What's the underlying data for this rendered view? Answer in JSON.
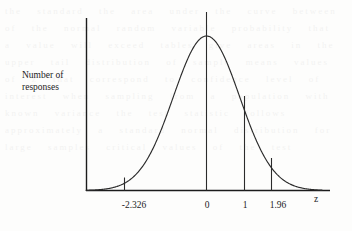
{
  "figure": {
    "background_color": "#fdfdfc",
    "ink_color": "#1c1c1c",
    "y_axis_label_line1": "Number of",
    "y_axis_label_line2": "responses",
    "x_axis_label": "z"
  },
  "bleed_text": "the standard the area under the curve between of the normal random variable probability that a value will exceed tables give areas in the upper tail distribution of sample means values of z that correspond to confidence level of interest when sampling from a population with known variance the test statistic follows approximately a standard normal distribution for large samples critical values of the test",
  "chart_data": {
    "type": "line",
    "title": "",
    "xlabel": "z",
    "ylabel": "Number of responses",
    "curve": "standard normal density",
    "xlim": [
      -3.6,
      3.6
    ],
    "ylim": [
      0,
      1.05
    ],
    "grid": false,
    "legend": null,
    "tick_labels": [
      "-2.326",
      "0",
      "1",
      "1.96"
    ],
    "tick_values": [
      -2.326,
      0,
      1,
      1.96
    ],
    "vertical_markers": [
      {
        "label": "-2.326",
        "z": -2.326,
        "density": 0.0267,
        "extends_above_curve": false
      },
      {
        "label": "0",
        "z": 0,
        "density": 1.0,
        "extends_above_curve": true
      },
      {
        "label": "1",
        "z": 1,
        "density": 0.6065,
        "extends_above_curve": false
      },
      {
        "label": "1.96",
        "z": 1.96,
        "density": 0.1456,
        "extends_above_curve": false
      }
    ],
    "x": [
      -3.6,
      -3.3,
      -3.0,
      -2.7,
      -2.4,
      -2.1,
      -1.8,
      -1.5,
      -1.2,
      -0.9,
      -0.6,
      -0.3,
      0.0,
      0.3,
      0.6,
      0.9,
      1.2,
      1.5,
      1.8,
      2.1,
      2.4,
      2.7,
      3.0,
      3.3,
      3.6
    ],
    "y": [
      0.0016,
      0.0042,
      0.0111,
      0.0265,
      0.0561,
      0.1085,
      0.1979,
      0.3247,
      0.4868,
      0.667,
      0.8353,
      0.956,
      1.0,
      0.956,
      0.8353,
      0.667,
      0.4868,
      0.3247,
      0.1979,
      0.1085,
      0.0561,
      0.0265,
      0.0111,
      0.0042,
      0.0016
    ]
  }
}
